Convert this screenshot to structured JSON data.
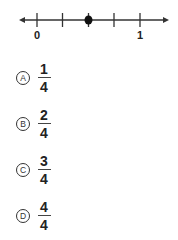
{
  "number_line": {
    "min_label": "0",
    "max_label": "1",
    "divisions": 4,
    "point_position": 2,
    "line_color": "#333333",
    "point_color": "#111111"
  },
  "options": [
    {
      "letter": "A",
      "numerator": "1",
      "denominator": "4"
    },
    {
      "letter": "B",
      "numerator": "2",
      "denominator": "4"
    },
    {
      "letter": "C",
      "numerator": "3",
      "denominator": "4"
    },
    {
      "letter": "D",
      "numerator": "4",
      "denominator": "4"
    }
  ]
}
